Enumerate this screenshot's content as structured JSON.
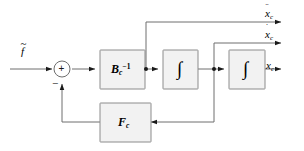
{
  "diagram": {
    "canvas": {
      "width": 304,
      "height": 151
    },
    "colors": {
      "background": "#ffffff",
      "block_fill": "#f2f2f2",
      "block_stroke": "#8c8c8c",
      "line": "#6e6e6e",
      "text": "#000000",
      "junction": "#1a1a1a"
    },
    "input": {
      "label_base": "f",
      "label_accent": "~",
      "label_text": "f̃"
    },
    "summing_junction": {
      "positive_sign": "+",
      "negative_sign": "−",
      "name": "sum-junction"
    },
    "blocks": [
      {
        "id": "b-inverse",
        "name": "block-bc-inverse",
        "base": "B",
        "subscript": "c",
        "superscript": "−1",
        "text": "B₁⁻¹"
      },
      {
        "id": "integrator-1",
        "name": "block-integrator-1",
        "base": "∫",
        "subscript": "",
        "superscript": "",
        "text": "∫"
      },
      {
        "id": "integrator-2",
        "name": "block-integrator-2",
        "base": "∫",
        "subscript": "",
        "superscript": "",
        "text": "∫"
      },
      {
        "id": "feedback",
        "name": "block-fc-feedback",
        "base": "F",
        "subscript": "c",
        "superscript": "",
        "text": "Fᶜ"
      }
    ],
    "outputs": [
      {
        "id": "acceleration",
        "name": "output-acceleration",
        "base": "x",
        "subscript": "c",
        "accent": "¨",
        "accent_kind": "double-dot",
        "text": "ẍₑ"
      },
      {
        "id": "velocity",
        "name": "output-velocity",
        "base": "x",
        "subscript": "c",
        "accent": "˙",
        "accent_kind": "single-dot",
        "text": "ẋₑ"
      },
      {
        "id": "position",
        "name": "output-position",
        "base": "x",
        "subscript": "c",
        "accent": "",
        "accent_kind": "none",
        "text": "xₑ"
      }
    ]
  }
}
